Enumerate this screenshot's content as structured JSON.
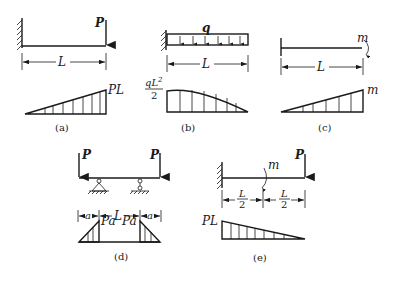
{
  "figure": {
    "panels": [
      {
        "id": "a",
        "caption": "(a)",
        "type": "cantilever with end point load",
        "load_label": "P",
        "span_label": "L",
        "moment_label": "PL",
        "moment_shape": "linear, max at free end"
      },
      {
        "id": "b",
        "caption": "(b)",
        "type": "cantilever with uniformly distributed load",
        "load_label": "q",
        "span_label": "L",
        "moment_label_num": "qL",
        "moment_label_exp": "2",
        "moment_label_den": "2",
        "moment_shape": "parabolic, max at fixed end"
      },
      {
        "id": "c",
        "caption": "(c)",
        "type": "beam with end moment",
        "load_label": "m",
        "span_label": "L",
        "moment_label": "m",
        "moment_shape": "linear, max at loaded end"
      },
      {
        "id": "d",
        "caption": "(d)",
        "type": "overhanging beam with two end point loads",
        "load_left_label": "P",
        "load_right_label": "P",
        "span_left_label": "a",
        "span_mid_label": "L",
        "span_right_label": "a",
        "moment_left_label": "Pa",
        "moment_right_label": "Pa",
        "moment_shape": "triangular over overhangs"
      },
      {
        "id": "e",
        "caption": "(e)",
        "type": "cantilever with mid moment and end point load",
        "load_moment_label": "m",
        "load_point_label": "P",
        "span_left_num": "L",
        "span_left_den": "2",
        "span_right_num": "L",
        "span_right_den": "2",
        "moment_label": "PL",
        "moment_shape": "linear, max at fixed end"
      }
    ]
  }
}
